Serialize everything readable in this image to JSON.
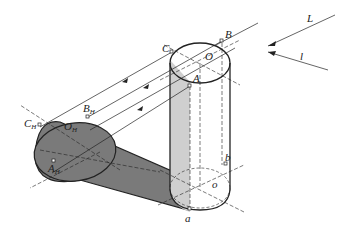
{
  "diagram": {
    "type": "shadow-construction",
    "colors": {
      "line": "#222222",
      "shadow_fill": "#7a7a7a",
      "self_shade_fill": "#cfcfcf",
      "background": "#ffffff"
    },
    "labels": {
      "L": "L",
      "l": "l",
      "O": "O",
      "B": "B",
      "C": "C",
      "A": "A",
      "b": "b",
      "o": "o",
      "a": "a",
      "B_H": {
        "base": "B",
        "sub": "H"
      },
      "C_H": {
        "base": "C",
        "sub": "H"
      },
      "A_H": {
        "base": "A",
        "sub": "H"
      },
      "O_H": {
        "base": "O",
        "sub": "H"
      }
    },
    "light_direction": {
      "ray_label": "L",
      "projection_label": "l"
    }
  }
}
